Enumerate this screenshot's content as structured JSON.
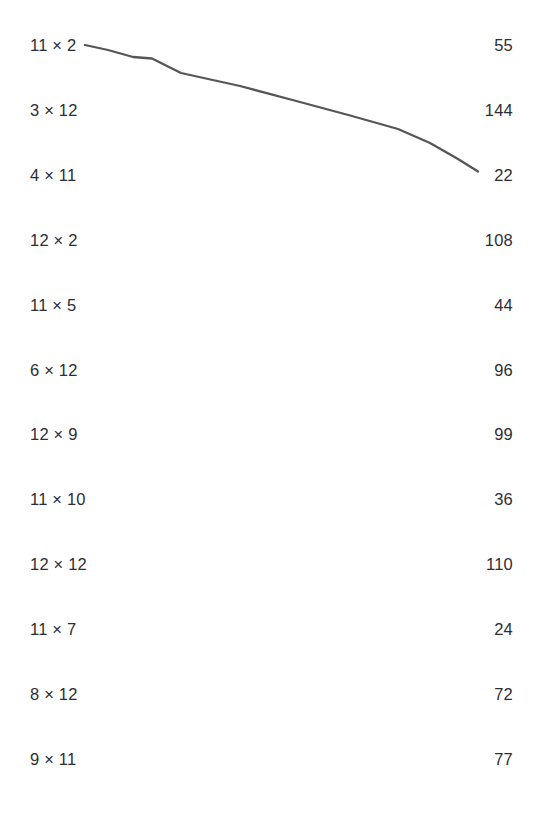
{
  "page": {
    "background_color": "#ffffff",
    "text_color": "#2e2e33",
    "width": 536,
    "height": 816
  },
  "layout": {
    "row_count": 12,
    "first_row_center_y": 45,
    "row_spacing": 64.9,
    "left_column_x": 30,
    "right_column_right_x": 513
  },
  "left_column": {
    "name": "expressions",
    "items": [
      {
        "label": "11 × 2"
      },
      {
        "label": "3 × 12"
      },
      {
        "label": "4 × 11"
      },
      {
        "label": "12 × 2"
      },
      {
        "label": "11 × 5"
      },
      {
        "label": "6 × 12"
      },
      {
        "label": "12 × 9"
      },
      {
        "label": "11 × 10"
      },
      {
        "label": "12 × 12"
      },
      {
        "label": "11 × 7"
      },
      {
        "label": "8 × 12"
      },
      {
        "label": "9 × 11"
      }
    ]
  },
  "right_column": {
    "name": "products",
    "items": [
      {
        "label": "55"
      },
      {
        "label": "144"
      },
      {
        "label": "22"
      },
      {
        "label": "108"
      },
      {
        "label": "44"
      },
      {
        "label": "96"
      },
      {
        "label": "99"
      },
      {
        "label": "36"
      },
      {
        "label": "110"
      },
      {
        "label": "24"
      },
      {
        "label": "72"
      },
      {
        "label": "77"
      }
    ]
  },
  "connections": [
    {
      "name": "connector-11x2-to-22",
      "from_label": "11 × 2",
      "to_label": "22",
      "from_index": 0,
      "to_index": 2,
      "stroke_color": "#55555a",
      "stroke_width": 2.3,
      "path": "M 85 45 L 108 50 L 133 57 L 152 58.5 L 181 73 L 240 86 L 300 102 L 352 116 L 398 129 L 430 143 L 458 159 L 478 171.5"
    }
  ]
}
